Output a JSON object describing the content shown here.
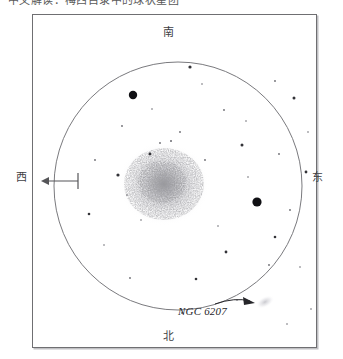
{
  "caption": {
    "text": "中文解读：梅西目录中的球状星团"
  },
  "plate": {
    "frame_color": "#6f6f72",
    "background": "#ffffff"
  },
  "cardinals": {
    "south": "南",
    "north": "北",
    "west": "西",
    "east": "东"
  },
  "drift_arrow": {
    "name": "drift-direction-arrow",
    "direction": "west",
    "color": "#555558"
  },
  "annotation": {
    "label": "NGC 6207",
    "arrow_color": "#26262a",
    "target_object": "faint-galaxy-smudge"
  },
  "chart_data": {
    "type": "scatter",
    "title": "",
    "field_circle": {
      "cx": 146,
      "cy": 172,
      "r": 124,
      "stroke": "#7a7a7e"
    },
    "cluster": {
      "name": "globular-cluster-glow",
      "cx": 132,
      "cy": 170,
      "rx": 44,
      "ry": 40,
      "core_color": "#9a9a9e",
      "halo_color": "#d8d8dc"
    },
    "ngc6207": {
      "cx": 233,
      "cy": 288,
      "rx": 9,
      "ry": 5,
      "angle": -28,
      "color": "#cfcfd4"
    },
    "bright_stars": [
      {
        "x": 101,
        "y": 81,
        "r": 4.2
      },
      {
        "x": 225,
        "y": 188,
        "r": 4.6
      }
    ],
    "medium_stars": [
      {
        "x": 158,
        "y": 53,
        "r": 1.6
      },
      {
        "x": 210,
        "y": 131,
        "r": 1.5
      },
      {
        "x": 86,
        "y": 161,
        "r": 1.6
      },
      {
        "x": 262,
        "y": 84,
        "r": 1.5
      },
      {
        "x": 118,
        "y": 140,
        "r": 1.4
      },
      {
        "x": 194,
        "y": 238,
        "r": 1.4
      },
      {
        "x": 243,
        "y": 223,
        "r": 1.3
      },
      {
        "x": 57,
        "y": 200,
        "r": 1.3
      },
      {
        "x": 274,
        "y": 158,
        "r": 1.4
      },
      {
        "x": 164,
        "y": 265,
        "r": 1.3
      }
    ],
    "faint_stars": [
      {
        "x": 128,
        "y": 129,
        "r": 0.9
      },
      {
        "x": 139,
        "y": 127,
        "r": 1.0
      },
      {
        "x": 148,
        "y": 118,
        "r": 0.9
      },
      {
        "x": 173,
        "y": 146,
        "r": 0.9
      },
      {
        "x": 192,
        "y": 96,
        "r": 0.9
      },
      {
        "x": 214,
        "y": 107,
        "r": 0.8
      },
      {
        "x": 247,
        "y": 140,
        "r": 0.9
      },
      {
        "x": 258,
        "y": 196,
        "r": 0.9
      },
      {
        "x": 237,
        "y": 251,
        "r": 0.9
      },
      {
        "x": 205,
        "y": 286,
        "r": 0.8
      },
      {
        "x": 150,
        "y": 299,
        "r": 0.9
      },
      {
        "x": 98,
        "y": 264,
        "r": 0.9
      },
      {
        "x": 72,
        "y": 231,
        "r": 0.8
      },
      {
        "x": 63,
        "y": 146,
        "r": 0.9
      },
      {
        "x": 90,
        "y": 112,
        "r": 0.9
      },
      {
        "x": 120,
        "y": 95,
        "r": 0.8
      },
      {
        "x": 170,
        "y": 70,
        "r": 0.8
      },
      {
        "x": 243,
        "y": 67,
        "r": 0.9
      },
      {
        "x": 276,
        "y": 118,
        "r": 0.8
      },
      {
        "x": 268,
        "y": 253,
        "r": 0.8
      },
      {
        "x": 186,
        "y": 212,
        "r": 0.8
      },
      {
        "x": 109,
        "y": 206,
        "r": 0.8
      },
      {
        "x": 95,
        "y": 181,
        "r": 0.8
      },
      {
        "x": 216,
        "y": 163,
        "r": 0.8
      },
      {
        "x": 255,
        "y": 310,
        "r": 0.8
      },
      {
        "x": 279,
        "y": 295,
        "r": 0.8
      }
    ]
  }
}
